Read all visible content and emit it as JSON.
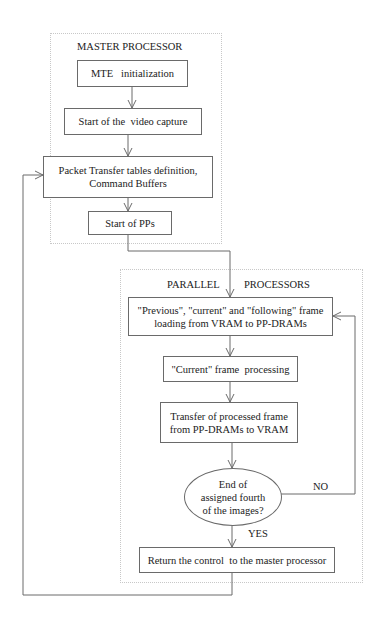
{
  "master": {
    "title": "MASTER PROCESSOR",
    "steps": [
      {
        "text": "MTE   initialization"
      },
      {
        "text": "Start of the  video capture"
      },
      {
        "text": "Packet Transfer tables definition,\nCommand Buffers"
      },
      {
        "text": "Start of PPs"
      }
    ]
  },
  "parallel": {
    "title_left": "PARALLEL",
    "title_right": "PROCESSORS",
    "steps": [
      {
        "text": "\"Previous\", \"current\"  and \"following\" frame\nloading from VRAM  to PP-DRAMs"
      },
      {
        "text": "\"Current\" frame  processing"
      },
      {
        "text": "Transfer of processed frame\nfrom PP-DRAMs to VRAM"
      }
    ],
    "decision": {
      "text": "End of\nassigned fourth\nof the images?",
      "no_label": "NO",
      "yes_label": "YES"
    },
    "final": {
      "text": "Return the control  to the master processor"
    }
  },
  "colors": {
    "line": "#6a6a6a",
    "region_border": "#c8c8c8"
  }
}
